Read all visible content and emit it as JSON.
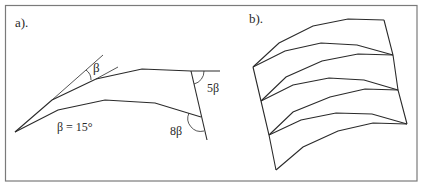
{
  "figure": {
    "frame_color": "#7a7a7a",
    "line_color": "#2a2a2a",
    "panels": [
      {
        "label": "a).",
        "annotations": {
          "beta_angle": "β",
          "beta_value": "β = 15°",
          "angle_5beta": "5β",
          "angle_8beta": "8β"
        }
      },
      {
        "label": "b)."
      }
    ]
  }
}
